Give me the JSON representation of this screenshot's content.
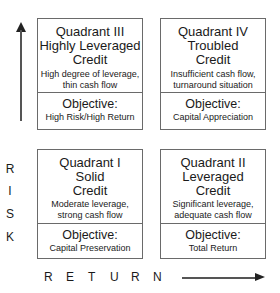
{
  "quadrants": {
    "q3": {
      "title_line1": "Quadrant III",
      "title_line2": "Highly Leveraged",
      "title_line3": "Credit",
      "desc_line1": "High degree of leverage,",
      "desc_line2": "thin cash flow",
      "objective_label": "Objective:",
      "objective_value": "High Risk/High Return"
    },
    "q4": {
      "title_line1": "Quadrant IV",
      "title_line2": "Troubled",
      "title_line3": "Credit",
      "desc_line1": "Insufficient cash flow,",
      "desc_line2": "turnaround situation",
      "objective_label": "Objective:",
      "objective_value": "Capital Appreciation"
    },
    "q1": {
      "title_line1": "Quadrant I",
      "title_line2": "Solid",
      "title_line3": "Credit",
      "desc_line1": "Moderate leverage,",
      "desc_line2": "strong cash flow",
      "objective_label": "Objective:",
      "objective_value": "Capital Preservation"
    },
    "q2": {
      "title_line1": "Quadrant II",
      "title_line2": "Leveraged",
      "title_line3": "Credit",
      "desc_line1": "Significant leverage,",
      "desc_line2": "adequate cash flow",
      "objective_label": "Objective:",
      "objective_value": "Total Return"
    }
  },
  "axes": {
    "y_label_letters": [
      "R",
      "I",
      "S",
      "K"
    ],
    "x_label_letters": [
      "R",
      "E",
      "T",
      "U",
      "R",
      "N"
    ],
    "arrow_icons": {
      "y": "arrow-up-icon",
      "x": "arrow-right-icon"
    }
  }
}
